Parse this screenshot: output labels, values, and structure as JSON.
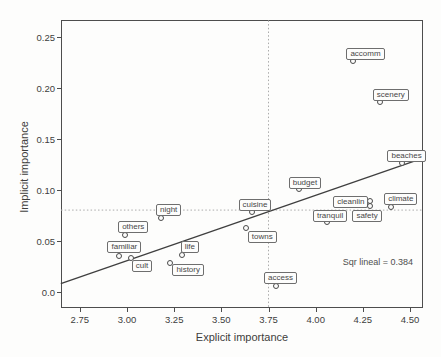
{
  "figure": {
    "background": "#fdfdfc"
  },
  "chart_data": {
    "type": "scatter",
    "title": "",
    "xlabel": "Explicit importance",
    "ylabel": "Implicit importance",
    "xlim": [
      2.65,
      4.57
    ],
    "ylim": [
      -0.016,
      0.266
    ],
    "x_ticks": [
      2.75,
      3.0,
      3.25,
      3.5,
      3.75,
      4.0,
      4.25,
      4.5
    ],
    "x_tick_labels": [
      "2.75",
      "3.00",
      "3.25",
      "3.50",
      "3.75",
      "4.00",
      "4.25",
      "4.50"
    ],
    "y_ticks": [
      0.0,
      0.05,
      0.1,
      0.15,
      0.2,
      0.25
    ],
    "y_tick_labels": [
      "0.0",
      "0.05",
      "0.10",
      "0.15",
      "0.20",
      "0.25"
    ],
    "grid": false,
    "legend": false,
    "marker": "open-circle",
    "points": [
      {
        "label": "accomm",
        "x": 4.2,
        "y": 0.226,
        "label_offset": [
          -7,
          -13
        ]
      },
      {
        "label": "scenery",
        "x": 4.34,
        "y": 0.186,
        "label_offset": [
          -7,
          -13
        ]
      },
      {
        "label": "beaches",
        "x": 4.46,
        "y": 0.126,
        "label_offset": [
          -15,
          -13
        ]
      },
      {
        "label": "budget",
        "x": 3.91,
        "y": 0.101,
        "label_offset": [
          -10,
          -12
        ]
      },
      {
        "label": "cuisine",
        "x": 3.66,
        "y": 0.078,
        "label_offset": [
          -13,
          -13
        ]
      },
      {
        "label": "cleanlin",
        "x": 4.29,
        "y": 0.089,
        "label_offset": [
          -2,
          -5
        ],
        "label_align": "right"
      },
      {
        "label": "climate",
        "x": 4.4,
        "y": 0.083,
        "label_offset": [
          -7,
          -14
        ]
      },
      {
        "label": "safety",
        "x": 4.29,
        "y": 0.084,
        "label_offset": [
          -18,
          4
        ]
      },
      {
        "label": "tranquil",
        "x": 4.06,
        "y": 0.068,
        "label_offset": [
          -14,
          -12
        ]
      },
      {
        "label": "night",
        "x": 3.18,
        "y": 0.072,
        "label_offset": [
          -5,
          -14
        ]
      },
      {
        "label": "others",
        "x": 2.99,
        "y": 0.056,
        "label_offset": [
          -7,
          -14
        ]
      },
      {
        "label": "familiar",
        "x": 2.96,
        "y": 0.035,
        "label_offset": [
          -12,
          -15
        ]
      },
      {
        "label": "cult",
        "x": 3.02,
        "y": 0.033,
        "label_offset": [
          1,
          2
        ]
      },
      {
        "label": "life",
        "x": 3.29,
        "y": 0.036,
        "label_offset": [
          -1,
          -14
        ]
      },
      {
        "label": "history",
        "x": 3.23,
        "y": 0.028,
        "label_offset": [
          2,
          1
        ]
      },
      {
        "label": "towns",
        "x": 3.63,
        "y": 0.062,
        "label_offset": [
          2,
          3
        ]
      },
      {
        "label": "access",
        "x": 3.79,
        "y": 0.006,
        "label_offset": [
          -12,
          -14
        ]
      }
    ],
    "fit_line": {
      "x1": 2.649,
      "y1": 0.008,
      "x2": 4.569,
      "y2": 0.131
    },
    "reference_lines": {
      "horizontal_y": 0.08,
      "vertical_x": 3.75
    },
    "annotation": "Sqr lineal = 0.384",
    "colors": {
      "fit_line": "#3f3f3f",
      "reference_line": "#ababab",
      "frame": "#4d4d4d",
      "marker_stroke": "#4a4a4a",
      "text": "#3d3d3d",
      "label_box_border": "#6e6e6e",
      "label_box_bg": "#fdfdfc"
    }
  }
}
